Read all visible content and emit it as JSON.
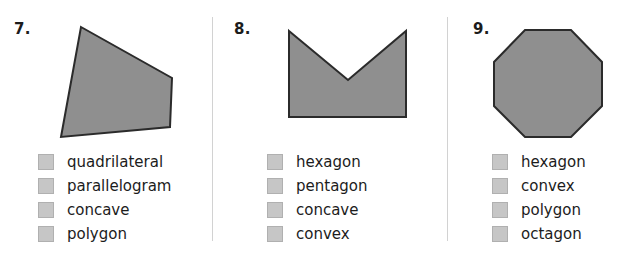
{
  "worksheet": {
    "style": {
      "shape_fill": "#8f8f8f",
      "shape_stroke": "#2b2b2b",
      "checkbox_fill": "#c6c6c6",
      "checkbox_border": "#b0b0b0",
      "divider_color": "#d2d2d2",
      "text_color": "#1c1c1c",
      "background": "#ffffff"
    },
    "problems": [
      {
        "number": "7.",
        "shape_name": "quadrilateral-shape",
        "shape_points": "81,27 172,78 170,127 61,137",
        "options": [
          {
            "label": "quadrilateral",
            "checked": false
          },
          {
            "label": "parallelogram",
            "checked": false
          },
          {
            "label": "concave",
            "checked": false
          },
          {
            "label": "polygon",
            "checked": false
          }
        ]
      },
      {
        "number": "8.",
        "shape_name": "concave-arrow-shape",
        "shape_points": "289,31 348,80 406,31 406,117 289,117",
        "options": [
          {
            "label": "hexagon",
            "checked": false
          },
          {
            "label": "pentagon",
            "checked": false
          },
          {
            "label": "concave",
            "checked": false
          },
          {
            "label": "convex",
            "checked": false
          }
        ]
      },
      {
        "number": "9.",
        "shape_name": "octagon-shape",
        "shape_points": "525,30 571,30 602,62 602,106 571,137 525,137 494,106 494,62",
        "options": [
          {
            "label": "hexagon",
            "checked": false
          },
          {
            "label": "convex",
            "checked": false
          },
          {
            "label": "polygon",
            "checked": false
          },
          {
            "label": "octagon",
            "checked": false
          }
        ]
      }
    ]
  }
}
